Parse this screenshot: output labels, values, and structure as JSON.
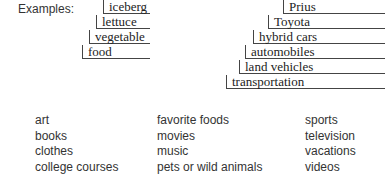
{
  "examples_label": "Examples:",
  "left_stack": [
    "iceberg",
    "lettuce",
    "vegetable",
    "food"
  ],
  "right_stack": [
    "Prius",
    "Toyota",
    "hybrid cars",
    "automobiles",
    "land vehicles",
    "transportation"
  ],
  "topics": {
    "col1": [
      "art",
      "books",
      "clothes",
      "college courses"
    ],
    "col2": [
      "favorite foods",
      "movies",
      "music",
      "pets or wild animals"
    ],
    "col3": [
      "sports",
      "television",
      "vacations",
      "videos"
    ]
  }
}
